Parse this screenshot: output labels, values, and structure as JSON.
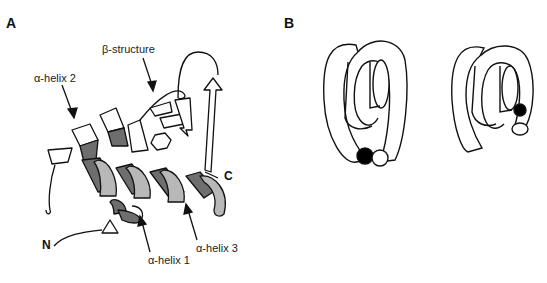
{
  "panels": [
    {
      "label": "A",
      "annotations": {
        "beta_structure": "β-structure",
        "helix2": "α-helix 2",
        "helix1": "α-helix 1",
        "helix3": "α-helix 3",
        "n_term": "N",
        "c_term": "C"
      },
      "colors": {
        "dark": "#6e6e6e",
        "light": "#b8b8b8",
        "line": "#111111"
      }
    },
    {
      "label": "B",
      "colors": {
        "filled": "#000000",
        "empty": "#ffffff"
      }
    }
  ]
}
